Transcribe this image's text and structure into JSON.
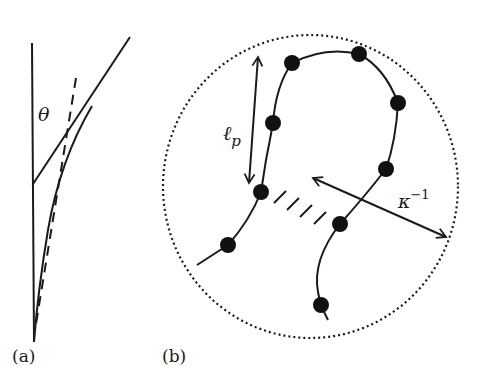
{
  "figure": {
    "panels": [
      {
        "id": "a",
        "label": "(a)",
        "angle_symbol": "θ",
        "description": "Vertical reference line, tangent line, dashed line and bent filament curve illustrating angle θ"
      },
      {
        "id": "b",
        "label": "(b)",
        "persistence_length_symbol": "ℓ",
        "persistence_length_subscript": "p",
        "debye_length_symbol": "κ",
        "debye_length_superscript": "−1",
        "bead_count": 9,
        "hash_mark_count": 4,
        "description": "Bead-chain polyelectrolyte inside dotted screening circle, with persistence length arrow and Debye length arrow"
      }
    ]
  },
  "colors": {
    "ink": "#1a1a1a",
    "background": "#ffffff"
  }
}
